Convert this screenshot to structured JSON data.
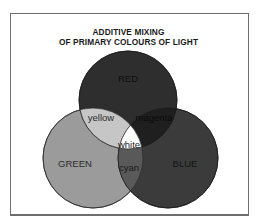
{
  "diagram": {
    "title_line1": "ADDITIVE MIXING",
    "title_line2": "OF PRIMARY COLOURS OF LIGHT",
    "circles": [
      {
        "name": "red",
        "label": "RED",
        "cx": 128,
        "cy": 100,
        "r": 49,
        "color": "#2e2e2e"
      },
      {
        "name": "green",
        "label": "GREEN",
        "cx": 93,
        "cy": 158,
        "r": 50,
        "color": "#9b9b9b"
      },
      {
        "name": "blue",
        "label": "BLUE",
        "cx": 168,
        "cy": 158,
        "r": 50,
        "color": "#3b3b3b"
      }
    ],
    "overlaps": [
      {
        "name": "yellow",
        "label": "yellow",
        "color": "#c6c6c6"
      },
      {
        "name": "magenta",
        "label": "magenta",
        "color": "#1f1f1f"
      },
      {
        "name": "cyan",
        "label": "cyan",
        "color": "#595959"
      },
      {
        "name": "white",
        "label": "white",
        "color": "#ffffff"
      }
    ]
  }
}
